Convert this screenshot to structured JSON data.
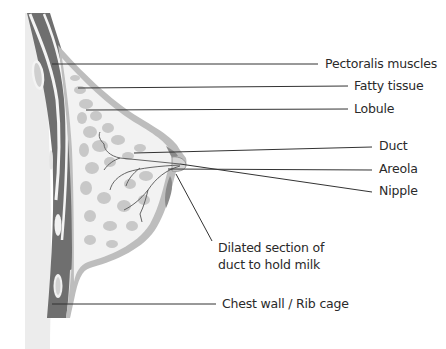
{
  "diagram": {
    "colors": {
      "background": "#ffffff",
      "skin_backdrop": "#ececec",
      "muscle": "#6f6f6f",
      "muscle_highlight": "#f4f4f4",
      "skin_outline": "#8d8d8d",
      "skin_fill": "#bdbdbd",
      "fatty_tissue": "#f1f1f1",
      "lobule": "#c9c9c9",
      "duct": "#555555",
      "leader_line": "#333333",
      "text": "#2a2a2a"
    },
    "labels": [
      {
        "id": "pectoralis",
        "text": "Pectoralis muscles",
        "x": 325,
        "y": 56
      },
      {
        "id": "fatty",
        "text": "Fatty tissue",
        "x": 354,
        "y": 78
      },
      {
        "id": "lobule",
        "text": "Lobule",
        "x": 354,
        "y": 101
      },
      {
        "id": "duct",
        "text": "Duct",
        "x": 379,
        "y": 138
      },
      {
        "id": "areola",
        "text": "Areola",
        "x": 379,
        "y": 161
      },
      {
        "id": "nipple",
        "text": "Nipple",
        "x": 379,
        "y": 182
      },
      {
        "id": "dilated_1",
        "text": "Dilated section of",
        "x": 218,
        "y": 240
      },
      {
        "id": "dilated_2",
        "text": "duct to hold milk",
        "x": 218,
        "y": 257
      },
      {
        "id": "chest",
        "text": "Chest wall / Rib cage",
        "x": 222,
        "y": 297
      }
    ]
  }
}
